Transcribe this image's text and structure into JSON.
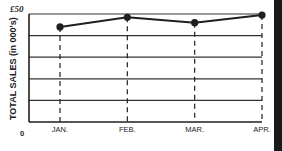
{
  "chart_data": {
    "type": "line",
    "title": "",
    "xlabel": "",
    "ylabel": "TOTAL SALES (in 000's)",
    "categories": [
      "JAN.",
      "FEB.",
      "MAR.",
      "APR."
    ],
    "series": [
      {
        "name": "Total sales",
        "values": [
          44,
          48.5,
          46,
          49.5
        ]
      }
    ],
    "ylim": [
      0,
      50
    ],
    "ytick_labels": {
      "max": "£50",
      "min": "0"
    },
    "y_gridlines": [
      0,
      10,
      20,
      30,
      40,
      50
    ],
    "grid": true,
    "vertical_drop_lines": "dashed",
    "legend": "none",
    "colors": {
      "line": "#1f1f1f",
      "grid": "#333333",
      "background": "#ffffff"
    }
  }
}
